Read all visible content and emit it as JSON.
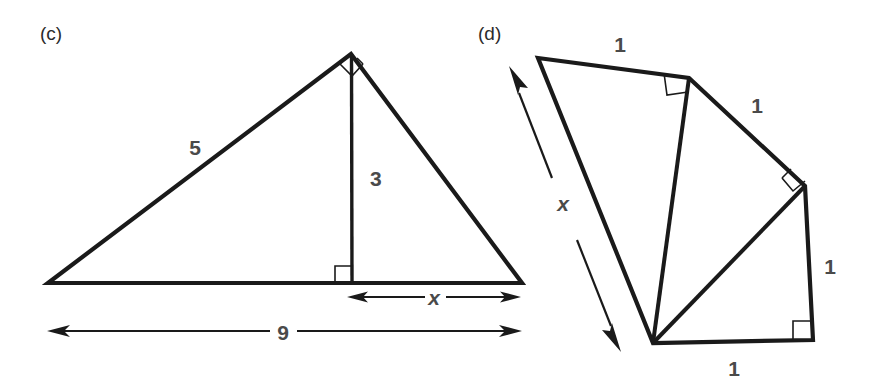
{
  "page": {
    "width": 875,
    "height": 392,
    "background": "#ffffff",
    "ink_color": "#1a1a1a",
    "label_color": "#4a4a4a"
  },
  "figures": [
    {
      "id": "figure-c",
      "caption": "(c)",
      "description": "Triangle with altitude drawn to the base, right angle at apex",
      "labels": {
        "side_left": "5",
        "altitude": "3",
        "segment_x": "x",
        "base": "9"
      },
      "geometry": {
        "left_vertex": [
          48,
          283
        ],
        "apex": [
          351,
          54
        ],
        "right_vertex": [
          522,
          283
        ],
        "foot_of_altitude": [
          352,
          283
        ]
      },
      "right_angles": [
        "apex",
        "foot-of-altitude"
      ],
      "dimension_arrows": [
        {
          "name": "x",
          "from": [
            348,
            297
          ],
          "to": [
            520,
            297
          ],
          "label": "x"
        },
        {
          "name": "9",
          "from": [
            48,
            331
          ],
          "to": [
            521,
            331
          ],
          "label": "9"
        }
      ]
    },
    {
      "id": "figure-d",
      "caption": "(d)",
      "description": "Spiral of Theodorus: three right triangles sharing a common vertex, each with a leg of length 1",
      "labels": {
        "side_1_top": "1",
        "side_2_upper_right": "1",
        "side_3_right": "1",
        "side_4_bottom": "1",
        "hypotenuse_x": "x"
      },
      "geometry": {
        "hub": [
          653,
          343
        ],
        "top_left": [
          538,
          58
        ],
        "top_right": [
          689,
          78
        ],
        "mid_right": [
          805,
          186
        ],
        "bottom_right": [
          813,
          340
        ]
      },
      "right_angles": [
        "top-right",
        "mid-right",
        "bottom-right"
      ],
      "dimension_arrows": [
        {
          "name": "x",
          "from": [
            510,
            70
          ],
          "to": [
            620,
            345
          ],
          "label": "x"
        }
      ]
    }
  ],
  "label_positions": {
    "caption_c": [
      40,
      40
    ],
    "caption_d": [
      478,
      40
    ],
    "five": [
      195,
      155
    ],
    "three": [
      370,
      186
    ],
    "x_c": [
      434,
      305
    ],
    "nine": [
      283,
      340
    ],
    "one_top": [
      620,
      52
    ],
    "one_upper_right": [
      757,
      113
    ],
    "one_right": [
      830,
      274
    ],
    "one_bottom": [
      734,
      376
    ],
    "x_d": [
      563,
      211
    ]
  }
}
